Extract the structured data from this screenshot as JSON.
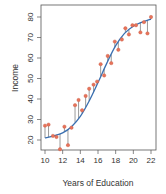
{
  "chart_data": {
    "type": "scatter",
    "title": "",
    "xlabel": "Years of Education",
    "ylabel": "Income",
    "xlim": [
      9.8,
      22.3
    ],
    "ylim": [
      14,
      84
    ],
    "x_ticks": [
      10,
      12,
      14,
      16,
      18,
      20,
      22
    ],
    "y_ticks": [
      20,
      30,
      40,
      50,
      60,
      70,
      80
    ],
    "grid": false,
    "legend": null,
    "colors": {
      "points": "#e8735a",
      "fit_line": "#3a6fb0",
      "residual_lines": "#555555",
      "axis": "#555555"
    },
    "series": [
      {
        "name": "observations",
        "x": [
          10.0,
          10.4,
          10.9,
          11.3,
          11.7,
          12.2,
          12.6,
          13.0,
          13.4,
          13.8,
          14.2,
          14.6,
          15.0,
          15.5,
          15.9,
          16.3,
          16.7,
          17.1,
          17.5,
          17.9,
          18.3,
          18.7,
          19.1,
          19.5,
          19.9,
          20.3,
          20.8,
          21.2,
          21.6,
          22.0
        ],
        "y": [
          27,
          27.5,
          22,
          21.5,
          15.5,
          26.5,
          17.5,
          26,
          37,
          39.5,
          34.5,
          41.5,
          45,
          47,
          48.5,
          57,
          51.5,
          61,
          57.5,
          68,
          64,
          69,
          74.5,
          71.5,
          76,
          76,
          72.5,
          77.5,
          72,
          80
        ]
      },
      {
        "name": "true function (sigmoid fit)",
        "type": "line",
        "x": [
          10,
          11,
          12,
          13,
          14,
          15,
          16,
          17,
          18,
          19,
          20,
          21,
          22
        ],
        "y": [
          21,
          22,
          23.5,
          26.5,
          31.5,
          39,
          48,
          57.5,
          66,
          72,
          75.5,
          77.5,
          79
        ]
      }
    ],
    "annotations": [
      "vertical residual segments connect each observation to the fitted curve"
    ]
  }
}
